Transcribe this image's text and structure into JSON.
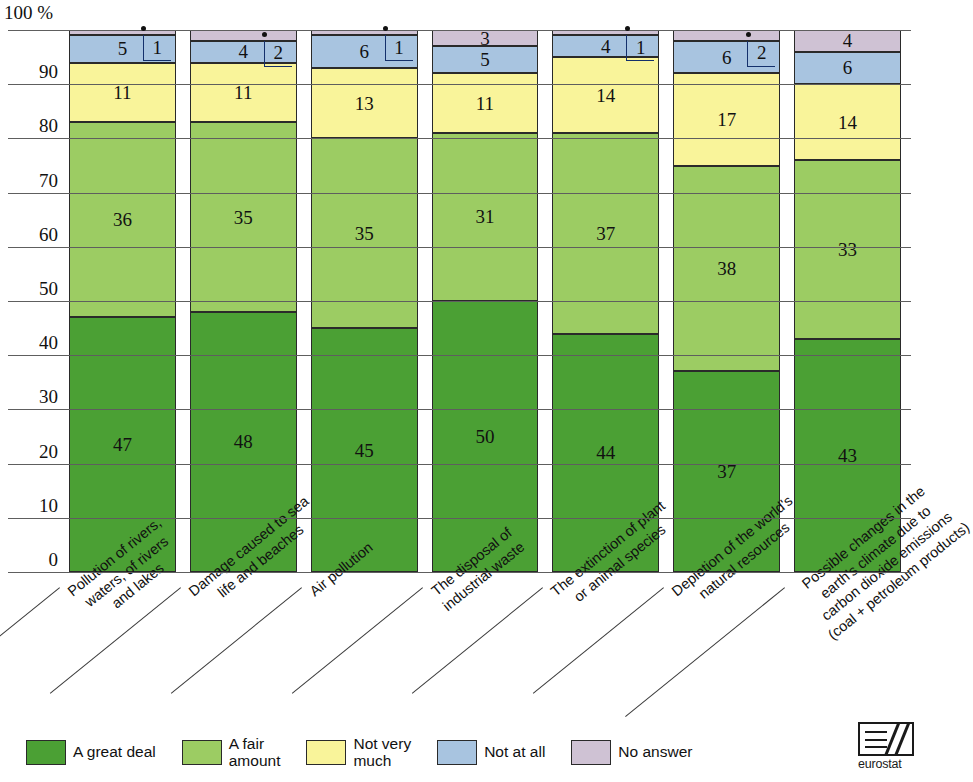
{
  "axis": {
    "unit_label": "100 %",
    "y_ticks": [
      "90",
      "80",
      "70",
      "60",
      "50",
      "40",
      "30",
      "20",
      "10",
      "0"
    ],
    "y_min": 0,
    "y_max": 100
  },
  "legend": {
    "items": [
      {
        "label": "A great deal",
        "color": "#4ba034"
      },
      {
        "label": "A fair\namount",
        "color": "#9ccc63"
      },
      {
        "label": "Not very\nmuch",
        "color": "#f9f49a"
      },
      {
        "label": "Not at all",
        "color": "#a8c4e0"
      },
      {
        "label": "No answer",
        "color": "#cfc2d4"
      }
    ]
  },
  "logo": {
    "text": "eurostat"
  },
  "chart_data": {
    "type": "bar",
    "stacked": true,
    "title": "",
    "xlabel": "",
    "ylabel": "100 %",
    "ylim": [
      0,
      100
    ],
    "grid": true,
    "legend_position": "bottom",
    "categories": [
      "Pollution of rivers,\nwaters, of rivers\nand lakes",
      "Damage caused to sea\nlife and beaches",
      "Air pollution",
      "The disposal of\nindustrial waste",
      "The extinction of plant\nor animal species",
      "Depletion of the world's\nnatural resources",
      "Possible changes in the\nearth's climate due to\ncarbon dioxide emissions\n(coal + petroleum products)"
    ],
    "series": [
      {
        "name": "A great deal",
        "color": "#4ba034",
        "values": [
          47,
          48,
          45,
          50,
          44,
          37,
          43
        ]
      },
      {
        "name": "A fair amount",
        "color": "#9ccc63",
        "values": [
          36,
          35,
          35,
          31,
          37,
          38,
          33
        ]
      },
      {
        "name": "Not very much",
        "color": "#f9f49a",
        "values": [
          11,
          11,
          13,
          11,
          14,
          17,
          14
        ]
      },
      {
        "name": "Not at all",
        "color": "#a8c4e0",
        "values": [
          5,
          4,
          6,
          5,
          4,
          6,
          6
        ]
      },
      {
        "name": "No answer",
        "color": "#cfc2d4",
        "values": [
          1,
          2,
          1,
          3,
          1,
          2,
          4
        ]
      }
    ],
    "callout_series": "No answer",
    "callout_bars": [
      0,
      1,
      2,
      4,
      5
    ]
  }
}
